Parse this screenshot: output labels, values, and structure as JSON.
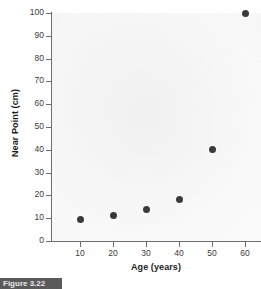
{
  "figure": {
    "caption_label": "Figure 3.22"
  },
  "chart_data": {
    "type": "scatter",
    "title": "",
    "xlabel": "Age (years)",
    "ylabel": "Near Point (cm)",
    "x": [
      10,
      20,
      30,
      40,
      50,
      60
    ],
    "values": [
      9.5,
      11,
      14,
      18,
      40,
      100
    ],
    "points": [
      {
        "x": 10,
        "y": 9.5
      },
      {
        "x": 20,
        "y": 11
      },
      {
        "x": 30,
        "y": 14
      },
      {
        "x": 40,
        "y": 18
      },
      {
        "x": 50,
        "y": 40
      },
      {
        "x": 60,
        "y": 100
      }
    ],
    "xlim": [
      0,
      65
    ],
    "ylim": [
      0,
      103
    ],
    "xticks": [
      10,
      20,
      30,
      40,
      50,
      60
    ],
    "yticks": [
      0,
      10,
      20,
      30,
      40,
      50,
      60,
      70,
      80,
      90,
      100
    ],
    "xtick_labels": [
      "10",
      "20",
      "30",
      "40",
      "50",
      "60"
    ],
    "ytick_labels": [
      "0",
      "10",
      "20",
      "30",
      "40",
      "50",
      "60",
      "70",
      "80",
      "90",
      "100"
    ],
    "grid": false,
    "legend": false,
    "marker_color": "#3a3a3a",
    "axis_color": "#6e6e6e",
    "plot_background": "#f5f5f5"
  }
}
